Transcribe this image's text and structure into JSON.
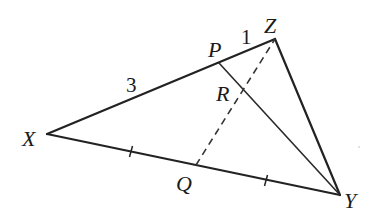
{
  "diagram": {
    "type": "triangle-with-cevians",
    "points": {
      "X": {
        "label": "X",
        "x": 47,
        "y": 134
      },
      "Z": {
        "label": "Z",
        "x": 275,
        "y": 39
      },
      "Y": {
        "label": "Y",
        "x": 340,
        "y": 195
      },
      "P": {
        "label": "P",
        "x": 219,
        "y": 63
      },
      "Q": {
        "label": "Q",
        "x": 196,
        "y": 165
      },
      "R": {
        "label": "R",
        "x": 241,
        "y": 91
      }
    },
    "segments": [
      {
        "from": "X",
        "to": "Z",
        "style": "solid"
      },
      {
        "from": "Z",
        "to": "Y",
        "style": "solid"
      },
      {
        "from": "X",
        "to": "Y",
        "style": "solid"
      },
      {
        "from": "P",
        "to": "Y",
        "style": "solid"
      },
      {
        "from": "Q",
        "to": "Z",
        "style": "dashed"
      }
    ],
    "lengths": {
      "XP": "3",
      "PZ": "1"
    },
    "equal_marks": [
      "XQ",
      "QY"
    ],
    "colors": {
      "line": "#222222",
      "background": "#ffffff"
    }
  }
}
